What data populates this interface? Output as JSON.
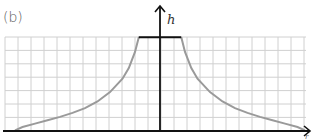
{
  "chart_data": {
    "type": "line",
    "title": "(b)",
    "xlabel": "r",
    "ylabel": "h",
    "grid": true,
    "legend": null,
    "x_range": [
      -12,
      12
    ],
    "y_range": [
      0,
      7
    ],
    "plateau": {
      "x_from": -1.7,
      "x_to": 1.7,
      "y": 7
    },
    "series": [
      {
        "name": "h(r)",
        "color": "#9a9a9a",
        "points_right": [
          [
            1.7,
            7.0
          ],
          [
            2.0,
            5.9
          ],
          [
            2.5,
            4.7
          ],
          [
            3.0,
            3.9
          ],
          [
            4.0,
            2.9
          ],
          [
            5.0,
            2.2
          ],
          [
            6.0,
            1.7
          ],
          [
            7.0,
            1.35
          ],
          [
            8.0,
            1.05
          ],
          [
            9.0,
            0.8
          ],
          [
            10.0,
            0.55
          ],
          [
            11.0,
            0.3
          ],
          [
            11.6,
            0.05
          ]
        ]
      }
    ],
    "colors": {
      "grid": "#d0d0d0",
      "axis": "#111111",
      "plateau": "#111111",
      "curve": "#9a9a9a"
    }
  },
  "labels": {
    "panel": "(b)",
    "y_axis": "h",
    "x_axis": "r"
  }
}
